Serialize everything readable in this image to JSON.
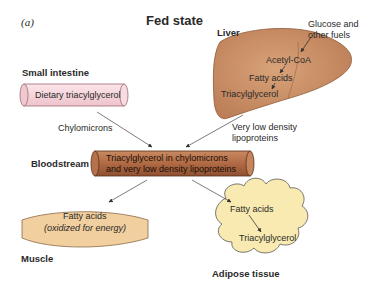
{
  "panel_label": "(a)",
  "title": "Fed state",
  "organs": {
    "small_intestine": {
      "name": "Small intestine",
      "content": "Dietary triacylglycerol"
    },
    "liver": {
      "name": "Liver",
      "steps": [
        "Acetyl-CoA",
        "Fatty acids",
        "Triacylglycerol"
      ],
      "input": "Glucose and\nother fuels",
      "input_line1": "Glucose and",
      "input_line2": "other fuels"
    },
    "bloodstream": {
      "name": "Bloodstream",
      "line1": "Triacylglycerol in chylomicrons",
      "line2": "and very low density lipoproteins"
    },
    "muscle": {
      "name": "Muscle",
      "line1": "Fatty acids",
      "line2": "(oxidized for energy)"
    },
    "adipose": {
      "name": "Adipose tissue",
      "steps": [
        "Fatty acids",
        "Triacylglycerol"
      ]
    }
  },
  "transports": {
    "chylomicrons": "Chylomicrons",
    "vldl_line1": "Very low density",
    "vldl_line2": "lipoproteins"
  },
  "colors": {
    "intestine_fill": "#f5d6dc",
    "liver_fill": "#c98e63",
    "blood_fill": "#b5704a",
    "muscle_fill": "#f2cf9e",
    "adipose_fill": "#f8eab0"
  }
}
